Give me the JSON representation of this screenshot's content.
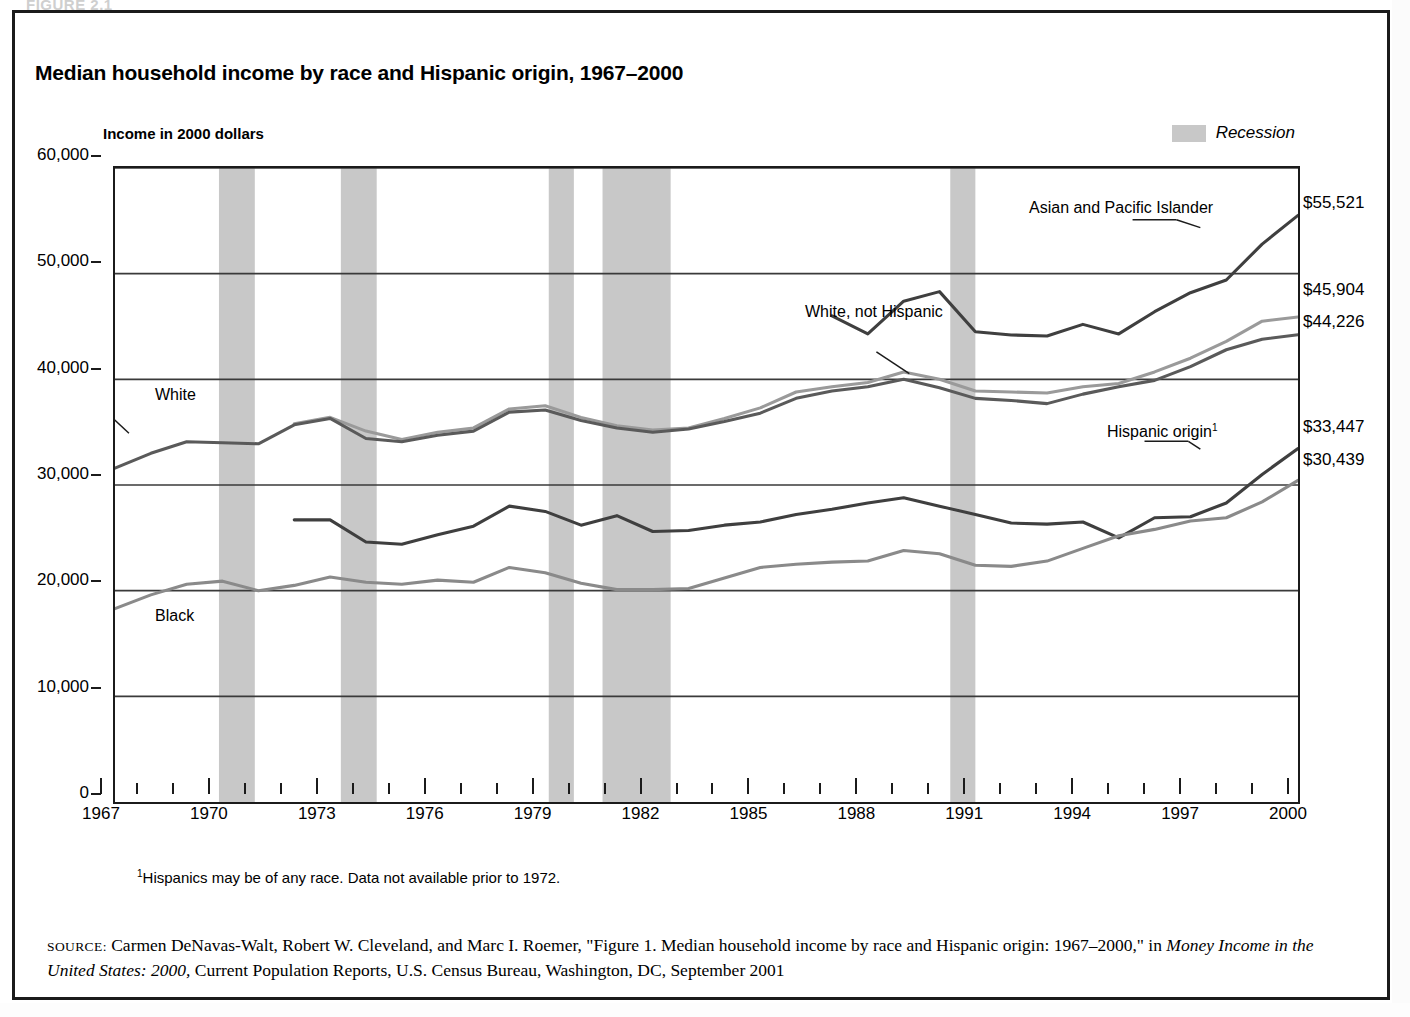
{
  "figure": {
    "caption_ghost": "FIGURE 2.1",
    "title": "Median household income by race and Hispanic origin, 1967–2000",
    "axis_note": "Income in 2000 dollars",
    "footnote_marker": "1",
    "footnote_text": "Hispanics may be of any race. Data not available prior to 1972.",
    "source_key": "SOURCE:",
    "source_part1": " Carmen DeNavas-Walt, Robert W. Cleveland, and Marc I. Roemer, \"Figure 1. Median household income by race and Hispanic origin: 1967–2000,\" in ",
    "source_italic": "Money Income in the United States: 2000,",
    "source_part2": " Current Population Reports, U.S. Census Bureau, Washington, DC, September 2001"
  },
  "legend": {
    "recession_label": "Recession",
    "recession_color": "#c8c8c8"
  },
  "colors": {
    "axis": "#1b1b1b",
    "gridline": "#3a3a3a",
    "asian": "#3f3f3f",
    "white_not_hispanic": "#9a9a9a",
    "white": "#5a5a5a",
    "hispanic": "#3f3f3f",
    "black": "#8a8a8a",
    "recession_band": "#c8c8c8"
  },
  "right_value_labels": [
    {
      "name": "asian-and-pacific-islander-value",
      "text": "$55,521",
      "value": 55521
    },
    {
      "name": "white-not-hispanic-value",
      "text": "$45,904",
      "value": 45904
    },
    {
      "name": "white-value",
      "text": "$44,226",
      "value": 44226
    },
    {
      "name": "hispanic-origin-value",
      "text": "$33,447",
      "value": 33447
    },
    {
      "name": "black-value",
      "text": "$30,439",
      "value": 30439
    }
  ],
  "series_annotations": [
    {
      "name": "annot-asian-and-pacific-islander",
      "text": "Asian and Pacific Islander"
    },
    {
      "name": "annot-white-not-hispanic",
      "text": "White, not Hispanic"
    },
    {
      "name": "annot-hispanic-origin",
      "text": "Hispanic origin",
      "sup": "1"
    },
    {
      "name": "annot-white",
      "text": "White"
    },
    {
      "name": "annot-black",
      "text": "Black"
    }
  ],
  "chart_data": {
    "type": "line",
    "title": "Median household income by race and Hispanic origin, 1967–2000",
    "subtitle": "Income in 2000 dollars",
    "xlabel": "",
    "ylabel": "Income in 2000 dollars",
    "xlim": [
      1967,
      2000
    ],
    "ylim": [
      0,
      60000
    ],
    "y_ticks": [
      0,
      10000,
      20000,
      30000,
      40000,
      50000,
      60000
    ],
    "y_tick_labels": [
      "0",
      "10,000",
      "20,000",
      "30,000",
      "40,000",
      "50,000",
      "60,000"
    ],
    "x_ticks": [
      1967,
      1968,
      1969,
      1970,
      1971,
      1972,
      1973,
      1974,
      1975,
      1976,
      1977,
      1978,
      1979,
      1980,
      1981,
      1982,
      1983,
      1984,
      1985,
      1986,
      1987,
      1988,
      1989,
      1990,
      1991,
      1992,
      1993,
      1994,
      1995,
      1996,
      1997,
      1998,
      1999,
      2000
    ],
    "x_tick_labels": [
      "1967",
      "1970",
      "1973",
      "1976",
      "1979",
      "1982",
      "1985",
      "1988",
      "1991",
      "1994",
      "1997",
      "2000"
    ],
    "x_tick_label_years": [
      1967,
      1970,
      1973,
      1976,
      1979,
      1982,
      1985,
      1988,
      1991,
      1994,
      1997,
      2000
    ],
    "grid": "horizontal",
    "legend_position": "top-right",
    "x": [
      1967,
      1968,
      1969,
      1970,
      1971,
      1972,
      1973,
      1974,
      1975,
      1976,
      1977,
      1978,
      1979,
      1980,
      1981,
      1982,
      1983,
      1984,
      1985,
      1986,
      1987,
      1988,
      1989,
      1990,
      1991,
      1992,
      1993,
      1994,
      1995,
      1996,
      1997,
      1998,
      1999,
      2000
    ],
    "series": [
      {
        "name": "Asian and Pacific Islander",
        "color": "#3f3f3f",
        "start_year": 1987,
        "values": [
          null,
          null,
          null,
          null,
          null,
          null,
          null,
          null,
          null,
          null,
          null,
          null,
          null,
          null,
          null,
          null,
          null,
          null,
          null,
          null,
          46000,
          44300,
          47400,
          48300,
          44500,
          44200,
          44100,
          45200,
          44300,
          46400,
          48200,
          49400,
          52800,
          55521
        ]
      },
      {
        "name": "White, not Hispanic",
        "color": "#9a9a9a",
        "start_year": 1972,
        "values": [
          null,
          null,
          null,
          null,
          null,
          35800,
          36400,
          35100,
          34300,
          35000,
          35400,
          37200,
          37500,
          36400,
          35600,
          35200,
          35400,
          36300,
          37300,
          38800,
          39300,
          39700,
          40700,
          40000,
          38900,
          38800,
          38700,
          39300,
          39600,
          40700,
          42000,
          43600,
          45500,
          45904
        ]
      },
      {
        "name": "White",
        "color": "#5a5a5a",
        "start_year": 1967,
        "values": [
          31600,
          33000,
          34100,
          34000,
          33900,
          35700,
          36300,
          34400,
          34100,
          34700,
          35100,
          36900,
          37100,
          36100,
          35400,
          35000,
          35300,
          36000,
          36800,
          38200,
          38900,
          39300,
          40000,
          39200,
          38200,
          38000,
          37700,
          38600,
          39300,
          39900,
          41200,
          42800,
          43800,
          44226
        ]
      },
      {
        "name": "Hispanic origin",
        "color": "#3f3f3f",
        "start_year": 1972,
        "footnote": "1",
        "values": [
          null,
          null,
          null,
          null,
          null,
          26700,
          26700,
          24600,
          24400,
          25300,
          26100,
          28000,
          27500,
          26200,
          27100,
          25600,
          25700,
          26200,
          26500,
          27200,
          27700,
          28300,
          28800,
          28000,
          27200,
          26400,
          26300,
          26500,
          25000,
          26900,
          27000,
          28300,
          31000,
          33447
        ]
      },
      {
        "name": "Black",
        "color": "#8a8a8a",
        "start_year": 1967,
        "values": [
          18300,
          19600,
          20600,
          20900,
          20000,
          20500,
          21300,
          20800,
          20600,
          21000,
          20800,
          22200,
          21700,
          20700,
          20100,
          20100,
          20200,
          21200,
          22200,
          22500,
          22700,
          22800,
          23800,
          23500,
          22400,
          22300,
          22800,
          24000,
          25200,
          25800,
          26600,
          26900,
          28400,
          30439
        ]
      }
    ],
    "recessions": [
      {
        "start": 1969.9,
        "end": 1970.9
      },
      {
        "start": 1973.3,
        "end": 1974.3
      },
      {
        "start": 1979.1,
        "end": 1979.8
      },
      {
        "start": 1980.6,
        "end": 1982.5
      },
      {
        "start": 1990.3,
        "end": 1991.0
      }
    ],
    "annotations": [
      {
        "text": "Asian and Pacific Islander",
        "series": "Asian and Pacific Islander"
      },
      {
        "text": "White, not Hispanic",
        "series": "White, not Hispanic"
      },
      {
        "text": "Hispanic origin1",
        "series": "Hispanic origin"
      },
      {
        "text": "White",
        "series": "White"
      },
      {
        "text": "Black",
        "series": "Black"
      }
    ]
  }
}
